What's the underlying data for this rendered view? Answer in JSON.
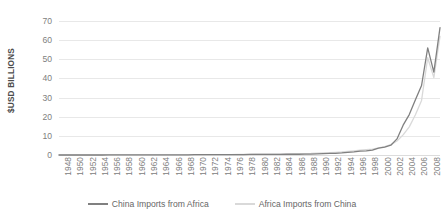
{
  "chart_data": {
    "type": "line",
    "title": "",
    "subtitle": "",
    "xlabel": "",
    "ylabel": "$USD BILLIONS",
    "ylim": [
      0,
      70
    ],
    "yticks": [
      0,
      10,
      20,
      30,
      40,
      50,
      60,
      70
    ],
    "ytick_labels": [
      "0",
      "10",
      "20",
      "30",
      "40",
      "50",
      "60",
      "70"
    ],
    "grid": true,
    "legend_position": "bottom",
    "x_tick_labels": [
      "1948",
      "1950",
      "1952",
      "1954",
      "1956",
      "1958",
      "1960",
      "1962",
      "1964",
      "1966",
      "1968",
      "1970",
      "1972",
      "1974",
      "1976",
      "1978",
      "1980",
      "1982",
      "1984",
      "1986",
      "1988",
      "1990",
      "1992",
      "1994",
      "1996",
      "1998",
      "2000",
      "2002",
      "2004",
      "2006",
      "2008",
      "2010"
    ],
    "x": [
      1948,
      1949,
      1950,
      1951,
      1952,
      1953,
      1954,
      1955,
      1956,
      1957,
      1958,
      1959,
      1960,
      1961,
      1962,
      1963,
      1964,
      1965,
      1966,
      1967,
      1968,
      1969,
      1970,
      1971,
      1972,
      1973,
      1974,
      1975,
      1976,
      1977,
      1978,
      1979,
      1980,
      1981,
      1982,
      1983,
      1984,
      1985,
      1986,
      1987,
      1988,
      1989,
      1990,
      1991,
      1992,
      1993,
      1994,
      1995,
      1996,
      1997,
      1998,
      1999,
      2000,
      2001,
      2002,
      2003,
      2004,
      2005,
      2006,
      2007,
      2008,
      2009,
      2010
    ],
    "series": [
      {
        "name": "China Imports from Africa",
        "color": "#808080",
        "values": [
          0,
          0,
          0,
          0,
          0,
          0,
          0,
          0,
          0.1,
          0.1,
          0.1,
          0.1,
          0.1,
          0.1,
          0.1,
          0.1,
          0.1,
          0.1,
          0.1,
          0.1,
          0.1,
          0.1,
          0.2,
          0.2,
          0.2,
          0.2,
          0.2,
          0.2,
          0.2,
          0.2,
          0.2,
          0.3,
          0.3,
          0.3,
          0.3,
          0.3,
          0.3,
          0.4,
          0.4,
          0.4,
          0.5,
          0.5,
          0.6,
          0.7,
          0.8,
          0.9,
          1.1,
          1.4,
          1.6,
          2.0,
          2.2,
          2.6,
          3.6,
          4.1,
          5.1,
          8.4,
          15.6,
          21.1,
          28.8,
          36.3,
          56.0,
          43.3,
          66.5
        ]
      },
      {
        "name": "Africa Imports from China",
        "color": "#d9d9d9",
        "values": [
          0,
          0,
          0,
          0,
          0,
          0,
          0,
          0,
          0.1,
          0.1,
          0.1,
          0.1,
          0.1,
          0.1,
          0.1,
          0.1,
          0.1,
          0.1,
          0.1,
          0.1,
          0.1,
          0.1,
          0.2,
          0.2,
          0.2,
          0.2,
          0.2,
          0.2,
          0.2,
          0.3,
          0.3,
          0.3,
          0.4,
          0.4,
          0.4,
          0.4,
          0.5,
          0.5,
          0.6,
          0.6,
          0.7,
          0.8,
          1.0,
          1.1,
          1.2,
          1.4,
          1.6,
          1.9,
          2.2,
          2.5,
          2.8,
          3.1,
          3.7,
          4.4,
          5.4,
          7.3,
          10.5,
          14.7,
          21.0,
          28.5,
          50.8,
          40.4,
          62.0
        ]
      }
    ]
  }
}
